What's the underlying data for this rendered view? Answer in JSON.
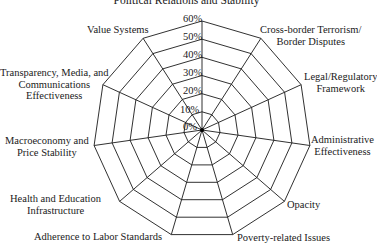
{
  "chart_data": {
    "type": "radar",
    "title": "Political Relations and Stability",
    "categories": [
      "Political Relations and Stability",
      "Cross-border Terrorism/\nBorder Disputes",
      "Legal/Regulatory\nFramework",
      "Administrative\nEffectiveness",
      "Opacity",
      "Poverty-related Issues",
      "Adherence to Labor Standards",
      "Health and Education\nInfrastructure",
      "Macroeconomy and\nPrice Stability",
      "Transparency, Media, and\nCommunications\nEffectiveness",
      "Value Systems"
    ],
    "radial_ticks": [
      "0%",
      "10%",
      "20%",
      "30%",
      "40%",
      "50%",
      "60%"
    ],
    "rlim": [
      0,
      60
    ],
    "series": [],
    "grid": true,
    "legend": null
  },
  "labels": {
    "title": "Political Relations and Stability",
    "axes": [
      "Political Relations and Stability",
      "Cross-border Terrorism/\nBorder Disputes",
      "Legal/Regulatory\nFramework",
      "Administrative\nEffectiveness",
      "Opacity",
      "Poverty-related Issues",
      "Adherence to Labor Standards",
      "Health and Education\nInfrastructure",
      "Macroeconomy and\nPrice Stability",
      "Transparency, Media, and\nCommunications\nEffectiveness",
      "Value Systems"
    ],
    "ticks": [
      "0%",
      "10%",
      "20%",
      "30%",
      "40%",
      "50%",
      "60%"
    ]
  }
}
